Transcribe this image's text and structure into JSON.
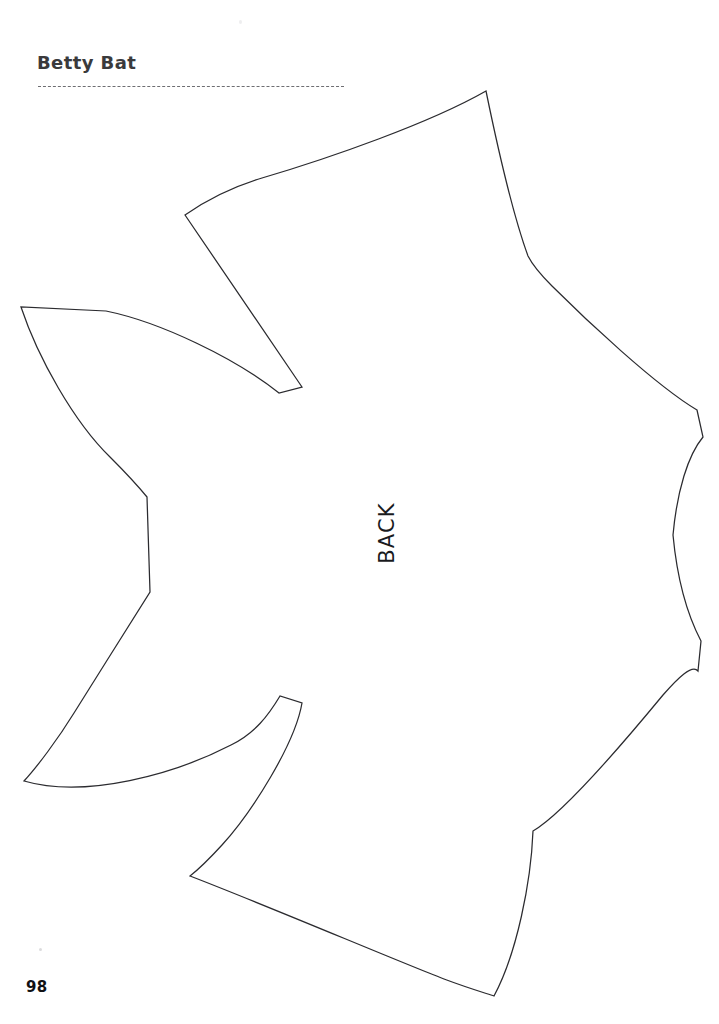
{
  "page": {
    "title": "Betty Bat",
    "page_number": "98",
    "background_color": "#ffffff",
    "width": 719,
    "height": 1024
  },
  "header": {
    "title": "Betty Bat",
    "divider_style": "dashed",
    "divider_color": "#6e6e72"
  },
  "pattern": {
    "name": "bat-template",
    "side_label": "BACK",
    "stroke_color": "#2b2b2f",
    "fill_color": "#ffffff",
    "stroke_width": "1.25",
    "outline_path": "M486,91 C430,123 330,158 262,178 C232,187 205,201 185,215 L302,387 L279,393 C235,358 160,322 106,311 L21,307 C38,358 74,422 110,457 C124,471 138,486 147,497 L150,592 C129,625 98,675 74,713 C58,739 37,767 24,781 C86,799 175,774 231,745 C255,733 268,716 280,696 L302,703 C295,744 252,812 222,845 C211,857 199,869 190,876 C268,906 390,958 444,979 C468,988 485,993 494,996 C517,953 531,882 533,831 C564,813 630,735 663,695 C678,678 692,664 698,671 L701,641 C690,620 678,588 673,535 C677,491 688,455 703,437 L697,410 C655,385 584,318 552,286 C540,274 532,264 528,256 C512,212 494,130 486,91 Z"
  },
  "labels": {
    "back": "BACK"
  }
}
